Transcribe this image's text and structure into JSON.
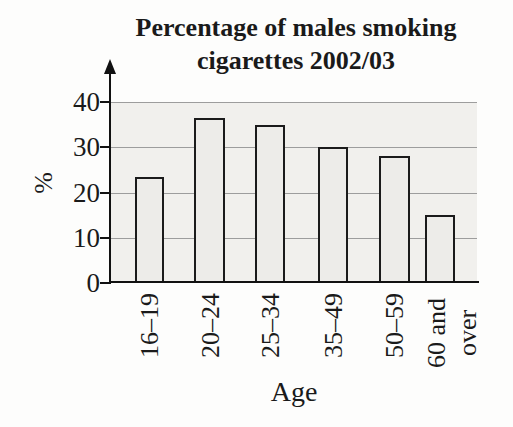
{
  "title": {
    "line1": "Percentage of males smoking",
    "line2": "cigarettes 2002/03"
  },
  "chart_data": {
    "type": "bar",
    "title": "Percentage of males smoking cigarettes 2002/03",
    "categories": [
      "16–19",
      "20–24",
      "25–34",
      "35–49",
      "50–59",
      "60 and over"
    ],
    "values": [
      23.5,
      36.5,
      35,
      30,
      28,
      15
    ],
    "xlabel": "Age",
    "ylabel": "%",
    "ylim": [
      0,
      40
    ],
    "yticks": [
      0,
      10,
      20,
      30,
      40
    ],
    "grid": true,
    "legend": "none",
    "colors": {
      "bar_fill": "#edece9",
      "bar_border": "#1b1b1b",
      "plot_background": "#f1f0ed",
      "gridline": "#9d9d9d",
      "axis": "#111111",
      "text": "#1a1a1a"
    }
  }
}
